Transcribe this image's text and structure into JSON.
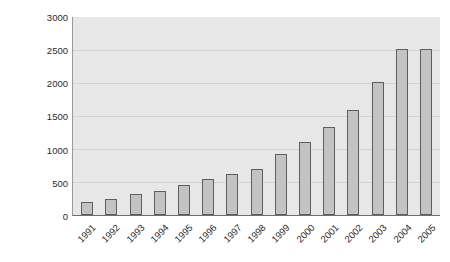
{
  "chart_data": {
    "type": "bar",
    "title": "",
    "subtitle": "",
    "xlabel": "",
    "ylabel": "$100 million RMB",
    "ylim": [
      0,
      3000
    ],
    "yticks": [
      0,
      500,
      1000,
      1500,
      2000,
      2500,
      3000
    ],
    "ytick_labels": [
      "0",
      "500",
      "1000",
      "1500",
      "2000",
      "2500",
      "3000"
    ],
    "grid": true,
    "legend": false,
    "legend_position": "none",
    "categories": [
      "1991",
      "1992",
      "1993",
      "1994",
      "1995",
      "1996",
      "1997",
      "1998",
      "1999",
      "2000",
      "2001",
      "2002",
      "2003",
      "2004",
      "2005"
    ],
    "values": [
      200,
      240,
      320,
      370,
      450,
      540,
      620,
      700,
      930,
      1100,
      1330,
      1590,
      2020,
      2510,
      2510
    ],
    "series": [
      {
        "name": "",
        "values": [
          200,
          240,
          320,
          370,
          450,
          540,
          620,
          700,
          930,
          1100,
          1330,
          1590,
          2020,
          2510,
          2510
        ]
      }
    ],
    "colors": {
      "bar_fill": "#c3c3c3",
      "bar_border": "#5e5e5e",
      "plot_background": "#e7e7e7",
      "gridline": "#d2d2d2",
      "axis": "#6f6f6f",
      "text": "#2b2b2b",
      "page_background": "#ffffff"
    }
  }
}
